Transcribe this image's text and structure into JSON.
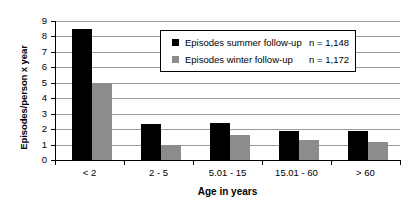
{
  "chart_data": {
    "type": "bar",
    "title": "",
    "xlabel": "Age in years",
    "ylabel": "Episodes/person x year",
    "categories": [
      "< 2",
      "2 - 5",
      "5.01 - 15",
      "15.01 - 60",
      "> 60"
    ],
    "series": [
      {
        "name": "Episodes summer follow-up",
        "color": "#000000",
        "n_label": "n = 1,148",
        "values": [
          8.5,
          2.3,
          2.4,
          1.9,
          1.85
        ]
      },
      {
        "name": "Episodes winter follow-up",
        "color": "#8c8c8c",
        "n_label": "n = 1,172",
        "values": [
          5.0,
          1.0,
          1.6,
          1.3,
          1.15
        ]
      }
    ],
    "ylim": [
      0,
      9
    ],
    "yticks": [
      "0",
      "1",
      "2",
      "3",
      "4",
      "5",
      "6",
      "7",
      "8",
      "9"
    ],
    "grid": true,
    "legend_position": "top-center"
  }
}
